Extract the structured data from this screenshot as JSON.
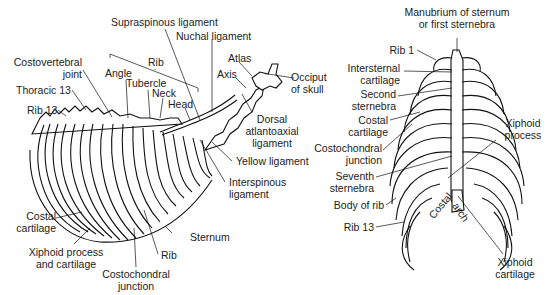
{
  "figure": {
    "left_panel": {
      "name": "Lateral view of thorax",
      "labels": {
        "supraspinous": "Supraspinous ligament",
        "nuchal": "Nuchal ligament",
        "costovertebral_1": "Costovertebral",
        "costovertebral_2": "joint",
        "rib_group": "Rib",
        "angle": "Angle",
        "tubercle": "Tubercle",
        "neck": "Neck",
        "head": "Head",
        "atlas": "Atlas",
        "axis": "Axis",
        "occiput_1": "Occiput",
        "occiput_2": "of skull",
        "thoracic13": "Thoracic 13",
        "rib13": "Rib 13",
        "dorsal_1": "Dorsal",
        "dorsal_2": "atlantoaxial",
        "dorsal_3": "ligament",
        "yellow": "Yellow ligament",
        "interspinous_1": "Interspinous",
        "interspinous_2": "ligament",
        "costal_cart_1": "Costal",
        "costal_cart_2": "cartilage",
        "sternum": "Sternum",
        "xiphoid_1": "Xiphoid process",
        "xiphoid_2": "and cartilage",
        "rib": "Rib",
        "costochondral_1": "Costochondral",
        "costochondral_2": "junction"
      }
    },
    "right_panel": {
      "name": "Ventral view of thorax",
      "labels": {
        "manubrium_1": "Manubrium of sternum",
        "manubrium_2": "or first sternebra",
        "rib1": "Rib 1",
        "intersternal_1": "Intersternal",
        "intersternal_2": "cartilage",
        "second_1": "Second",
        "second_2": "sternebra",
        "costal_1": "Costal",
        "costal_2": "cartilage",
        "costochondral_1": "Costochondral",
        "costochondral_2": "junction",
        "seventh_1": "Seventh",
        "seventh_2": "sternebra",
        "body_of_rib": "Body of rib",
        "rib13": "Rib 13",
        "xiphoid_proc_1": "Xiphoid",
        "xiphoid_proc_2": "process",
        "costal_arch_1": "Costal",
        "costal_arch_2": "arch",
        "xiphoid_cart_1": "Xiphoid",
        "xiphoid_cart_2": "cartilage"
      }
    }
  }
}
